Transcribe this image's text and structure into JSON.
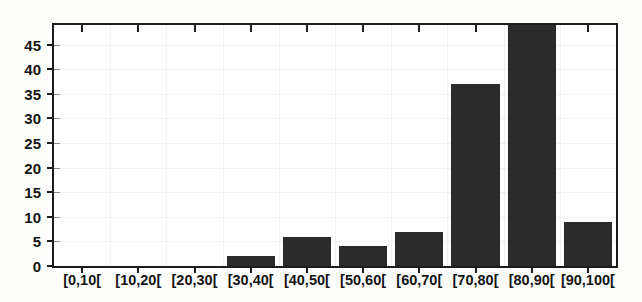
{
  "chart_data": {
    "type": "bar",
    "title": "",
    "subtitle": "",
    "xlabel": "",
    "ylabel": "",
    "categories": [
      "[0,10[",
      "[10,20[",
      "[20,30[",
      "[30,40[",
      "[40,50[",
      "[50,60[",
      "[60,70[",
      "[70,80[",
      "[80,90[",
      "[90,100["
    ],
    "values": [
      0,
      0,
      0,
      2,
      6,
      4,
      7,
      37,
      49,
      9
    ],
    "clipped_bars": [
      8
    ],
    "ylim": [
      0,
      49
    ],
    "ytick_labels": [
      "0",
      "5",
      "10",
      "15",
      "20",
      "25",
      "30",
      "35",
      "40",
      "45"
    ],
    "ytick_values": [
      0,
      5,
      10,
      15,
      20,
      25,
      30,
      35,
      40,
      45
    ],
    "grid": true,
    "legend": "none",
    "bar_color": "#2b2b2b",
    "axis_color": "#1d1d1d",
    "grid_color": "#f1f1f1",
    "background_color": "#fefefe"
  }
}
